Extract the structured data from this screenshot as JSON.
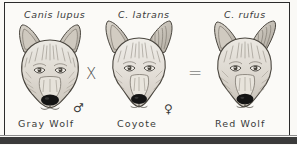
{
  "figure": {
    "type": "hybridization-diagram",
    "caption_absent": true,
    "panels": [
      {
        "id": "gray-wolf",
        "scientific_name": "Canis lupus",
        "common_name": "Gray Wolf",
        "sex_symbol": "♂",
        "sex": "male",
        "role": "parent"
      },
      {
        "id": "coyote",
        "scientific_name": "C. latrans",
        "common_name": "Coyote",
        "sex_symbol": "♀",
        "sex": "female",
        "role": "parent"
      },
      {
        "id": "red-wolf",
        "scientific_name": "C. rufus",
        "common_name": "Red Wolf",
        "sex_symbol": "",
        "sex": "",
        "role": "offspring"
      }
    ],
    "operators": {
      "cross": "X",
      "equals": "="
    },
    "colors": {
      "ink": "#3a3a3a",
      "frame": "#2b2b2b",
      "paper": "#fbfaf7",
      "bottom_bar": "#3b3b3b",
      "fur_light": "#e8e4dc",
      "fur_mid": "#c3bdb3",
      "fur_dark": "#8e8880",
      "nose": "#1a1a1a"
    }
  }
}
